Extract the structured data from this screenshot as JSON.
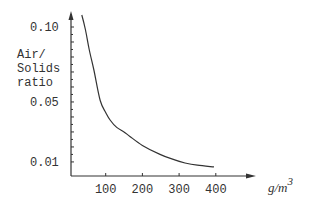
{
  "chart_data": {
    "type": "line",
    "title": "",
    "xlabel": "g/m3",
    "xlabel_unit_base": "g/m",
    "xlabel_unit_exp": "3",
    "ylabel_lines": [
      "Air/",
      "Solids",
      "ratio"
    ],
    "ylabel": "Air/Solids ratio",
    "x_ticks": [
      100,
      200,
      300,
      400
    ],
    "x_tick_labels": [
      "100",
      "200",
      "300",
      "400"
    ],
    "y_ticks": [
      0.1,
      0.05,
      0.01
    ],
    "y_tick_labels": [
      "0.10",
      "0.05",
      "0.01"
    ],
    "xlim": [
      0,
      450
    ],
    "ylim": [
      0,
      0.11
    ],
    "grid": false,
    "legend": null,
    "series": [
      {
        "name": "Air/Solids ratio",
        "x": [
          35,
          45,
          55,
          68,
          85,
          100,
          112,
          130,
          150,
          166,
          200,
          248,
          280,
          316,
          350,
          395
        ],
        "y": [
          0.108,
          0.098,
          0.085,
          0.071,
          0.051,
          0.043,
          0.038,
          0.033,
          0.03,
          0.027,
          0.021,
          0.015,
          0.012,
          0.0093,
          0.0078,
          0.0067
        ]
      }
    ]
  }
}
